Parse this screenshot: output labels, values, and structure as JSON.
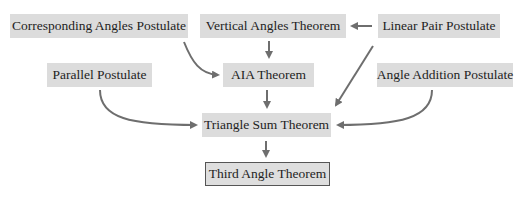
{
  "diagram": {
    "nodes": [
      {
        "id": "corresponding",
        "label": "Corresponding Angles Postulate"
      },
      {
        "id": "vertical",
        "label": "Vertical Angles Theorem"
      },
      {
        "id": "linear",
        "label": "Linear Pair Postulate"
      },
      {
        "id": "parallel",
        "label": "Parallel Postulate"
      },
      {
        "id": "aia",
        "label": "AIA Theorem"
      },
      {
        "id": "angleadd",
        "label": "Angle Addition Postulate"
      },
      {
        "id": "trisum",
        "label": "Triangle Sum Theorem"
      },
      {
        "id": "third",
        "label": "Third Angle Theorem"
      }
    ],
    "edges": [
      {
        "from": "linear",
        "to": "vertical"
      },
      {
        "from": "vertical",
        "to": "aia"
      },
      {
        "from": "corresponding",
        "to": "aia"
      },
      {
        "from": "linear",
        "to": "trisum"
      },
      {
        "from": "aia",
        "to": "trisum"
      },
      {
        "from": "parallel",
        "to": "trisum"
      },
      {
        "from": "angleadd",
        "to": "trisum"
      },
      {
        "from": "trisum",
        "to": "third"
      }
    ],
    "colors": {
      "box": "#dcdcdc",
      "arrow": "#6e6e6e",
      "text": "#1e1e1e"
    }
  }
}
